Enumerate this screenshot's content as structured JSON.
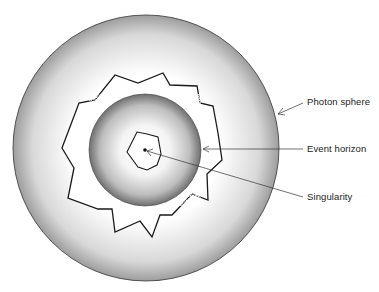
{
  "diagram": {
    "type": "black-hole-structure",
    "labels": {
      "photon_sphere": "Photon sphere",
      "event_horizon": "Event horizon",
      "singularity": "Singularity"
    },
    "colors": {
      "ink": "#1a1a1a",
      "background": "#ffffff"
    }
  }
}
